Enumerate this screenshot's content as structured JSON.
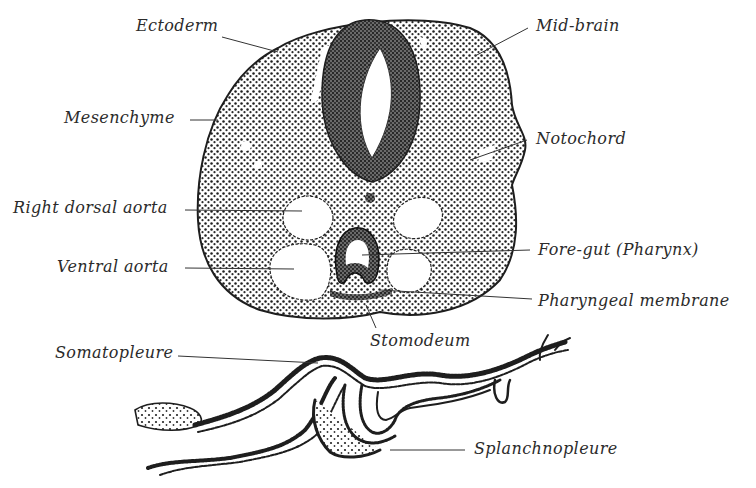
{
  "figure": {
    "colors": {
      "background": "#ffffff",
      "ink": "#1e1e1e",
      "label_text": "#2b2b2b",
      "tissue_light": "#9a9a9a",
      "tissue_dark": "#4a4a4a"
    }
  },
  "labels": {
    "ectoderm": "Ectoderm",
    "mid_brain": "Mid-brain",
    "mesenchyme": "Mesenchyme",
    "notochord": "Notochord",
    "right_dorsal_aorta": "Right dorsal aorta",
    "fore_gut": "Fore-gut (Pharynx)",
    "ventral_aorta": "Ventral aorta",
    "pharyngeal_membrane": "Pharyngeal membrane",
    "stomodeum": "Stomodeum",
    "somatopleure": "Somatopleure",
    "splanchnopleure": "Splanchnopleure"
  }
}
